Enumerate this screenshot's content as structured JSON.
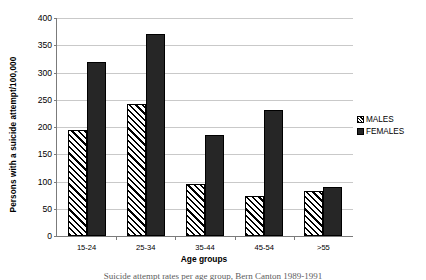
{
  "chart_data": {
    "type": "bar",
    "title": "",
    "xlabel": "Age groups",
    "ylabel": "Persons with a suicide attempt/100,000",
    "categories": [
      "15-24",
      "25-34",
      "35-44",
      "45-54",
      ">55"
    ],
    "series": [
      {
        "name": "MALES",
        "values": [
          195,
          243,
          96,
          73,
          82
        ],
        "pattern": "diagonal-hatch",
        "color": "#ffffff"
      },
      {
        "name": "FEMALES",
        "values": [
          320,
          370,
          186,
          231,
          90
        ],
        "pattern": "solid",
        "color": "#262626"
      }
    ],
    "ylim": [
      0,
      400
    ],
    "yticks": [
      0,
      50,
      100,
      150,
      200,
      250,
      300,
      350,
      400
    ],
    "ytick_labels": [
      "0",
      "50",
      "100",
      "150",
      "200",
      "250",
      "300",
      "350",
      "400"
    ],
    "grid": true,
    "legend_position": "right"
  },
  "legend": {
    "items": [
      {
        "label": "MALES"
      },
      {
        "label": "FEMALES"
      }
    ]
  },
  "caption": {
    "text": "Suicide attempt rates per age group, Bern Canton 1989-1991"
  }
}
